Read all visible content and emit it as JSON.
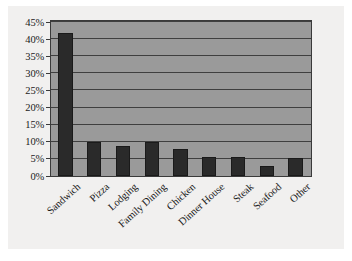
{
  "chart_data": {
    "type": "bar",
    "title": "",
    "subtitle": "",
    "xlabel": "",
    "ylabel": "",
    "categories": [
      "Sandwich",
      "Pizza",
      "Lodging",
      "Family Dining",
      "Chicken",
      "Dinner House",
      "Steak",
      "Seafood",
      "Other"
    ],
    "values": [
      41.7,
      9.9,
      8.7,
      9.8,
      8.0,
      5.7,
      5.6,
      2.9,
      5.3
    ],
    "ylim": [
      0,
      45
    ],
    "ytick_step": 5,
    "ytick_labels": [
      "0%",
      "5%",
      "10%",
      "15%",
      "20%",
      "25%",
      "30%",
      "35%",
      "40%",
      "45%"
    ],
    "ytick_values": [
      0,
      5,
      10,
      15,
      20,
      25,
      30,
      35,
      40,
      45
    ],
    "grid": true,
    "grid_orientation": "horizontal",
    "legend": false,
    "legend_position": "none",
    "value_format": "percent",
    "xtick_rotation": -42
  },
  "style": {
    "page_background": "#ffffff",
    "card_background": "#f1f0ef",
    "plot_background": "#9a9a9a",
    "bar_color": "#2a2a2a",
    "gridline_color": "#3f3f3f",
    "axis_color": "#3a3a3a",
    "text_color": "#1b1b1b"
  }
}
